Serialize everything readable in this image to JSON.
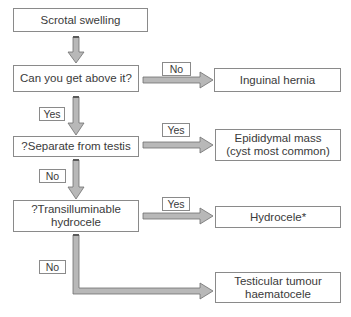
{
  "flowchart": {
    "nodes": {
      "start": "Scrotal swelling",
      "q1": "Can you get above it?",
      "q2": "?Separate from testis",
      "q3": "?Transilluminable\nhydrocele",
      "hernia": "Inguinal hernia",
      "epididymal": "Epididymal mass\n(cyst most common)",
      "hydrocele": "Hydrocele*",
      "tumour": "Testicular tumour\nhaematocele"
    },
    "edge_labels": {
      "q1_no": "No",
      "q1_yes": "Yes",
      "q2_yes": "Yes",
      "q2_no": "No",
      "q3_yes": "Yes",
      "q3_no": "No"
    },
    "colors": {
      "arrow_fill": "#b4b4b4",
      "arrow_stroke": "#6e6e6e",
      "box_border": "#8a8a8a"
    }
  }
}
